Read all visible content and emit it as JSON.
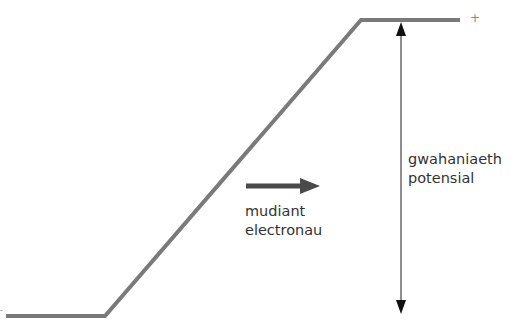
{
  "diagram": {
    "type": "potential-difference-slope",
    "colors": {
      "line": "#7a7a7a",
      "arrow": "#4a4a4a",
      "dim_arrow": "#222222",
      "text": "#333333"
    },
    "signs": {
      "high": "+",
      "low": "-"
    },
    "labels": {
      "electron_flow_line1": "mudiant",
      "electron_flow_line2": "electronau",
      "potential_diff_line1": "gwahaniaeth",
      "potential_diff_line2": "potensial"
    }
  }
}
